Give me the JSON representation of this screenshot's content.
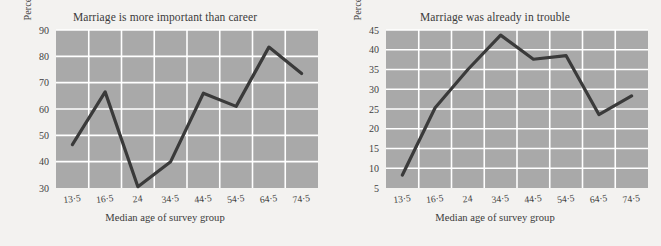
{
  "figure": {
    "background_color": "#f3f2f0",
    "plot_area_color": "#a9a9a9",
    "gridline_color": "#ffffff",
    "series_color": "#3a3a3a"
  },
  "panels": [
    {
      "name": "marriage-more-important-than-career",
      "title": "Marriage is more important than career",
      "xlabel": "Median age of survey group",
      "ylabel": "Percentage displaying schema",
      "xticks": [
        "13·5",
        "16·5",
        "24",
        "34·5",
        "44·5",
        "54·5",
        "64·5",
        "74·5"
      ],
      "yticks": [
        "30",
        "40",
        "50",
        "60",
        "70",
        "80",
        "90"
      ]
    },
    {
      "name": "marriage-already-in-trouble",
      "title": "Marriage was already in trouble",
      "xlabel": "Median age of survey group",
      "ylabel": "Percentage displaying schema",
      "xticks": [
        "13·5",
        "16·5",
        "24",
        "34·5",
        "44·5",
        "54·5",
        "64·5",
        "74·5"
      ],
      "yticks": [
        "5",
        "10",
        "15",
        "20",
        "25",
        "30",
        "35",
        "40",
        "45"
      ]
    }
  ],
  "chart_data": [
    {
      "type": "line",
      "title": "Marriage is more important than career",
      "xlabel": "Median age of survey group",
      "ylabel": "Percentage displaying schema",
      "categories": [
        "13·5",
        "16·5",
        "24",
        "34·5",
        "44·5",
        "54·5",
        "64·5",
        "74·5"
      ],
      "values": [
        46.5,
        66.5,
        30.5,
        40,
        66,
        61,
        83.5,
        73.5
      ],
      "ylim": [
        30,
        90
      ],
      "ytick_step": 10,
      "grid": true,
      "legend": "none"
    },
    {
      "type": "line",
      "title": "Marriage was already in trouble",
      "xlabel": "Median age of survey group",
      "ylabel": "Percentage displaying schema",
      "categories": [
        "13·5",
        "16·5",
        "24",
        "34·5",
        "44·5",
        "54·5",
        "64·5",
        "74·5"
      ],
      "values": [
        8.3,
        25.3,
        35,
        43.7,
        37.6,
        38.5,
        23.6,
        28.3
      ],
      "ylim": [
        5,
        45
      ],
      "ytick_step": 5,
      "grid": true,
      "legend": "none"
    }
  ]
}
